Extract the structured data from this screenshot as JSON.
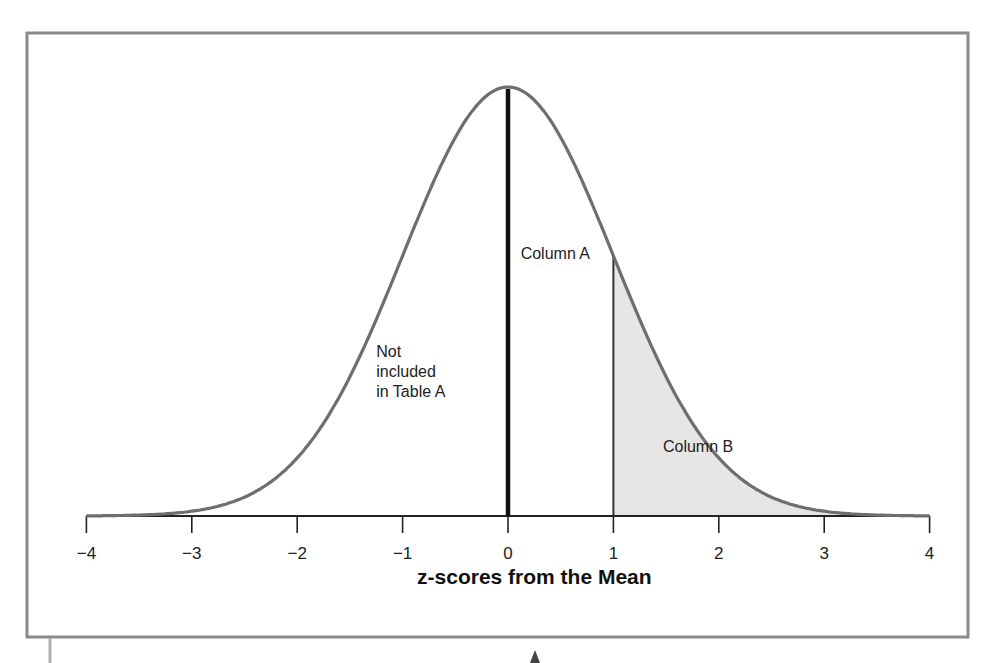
{
  "chart_data": {
    "type": "area",
    "title": "",
    "xlabel": "z-scores from the Mean",
    "ylabel": "",
    "xlim": [
      -4,
      4
    ],
    "x_ticks": [
      -4,
      -3,
      -2,
      -1,
      0,
      1,
      2,
      3,
      4
    ],
    "x_tick_labels": [
      "−4",
      "−3",
      "−2",
      "−1",
      "0",
      "1",
      "2",
      "3",
      "4"
    ],
    "curve": {
      "name": "Standard normal distribution",
      "mean": 0,
      "sd": 1
    },
    "mean_line": {
      "z": 0
    },
    "cutoff_line": {
      "z": 1
    },
    "shaded_region": {
      "from_z": 1,
      "to_z": 4,
      "label": "Column B"
    },
    "annotations": [
      {
        "id": "column-a",
        "text": "Column A",
        "z": 0.12,
        "height_frac": 0.6
      },
      {
        "id": "not-included",
        "lines": [
          "Not",
          "included",
          "in Table A"
        ],
        "z": -1.25,
        "height_frac": 0.37
      },
      {
        "id": "column-b",
        "text": "Column B",
        "z": 1.47,
        "height_frac": 0.15
      }
    ],
    "grid": false,
    "legend": null
  },
  "colors": {
    "frame": "#8a8a8a",
    "curve": "#6e6e6e",
    "mean_line": "#111111",
    "cutoff_line": "#333333",
    "shade": "#e6e6e6",
    "axis": "#222222"
  },
  "layout": {
    "x0_px": 508,
    "px_per_z": 105.4,
    "baseline_px": 516,
    "peak_height_px": 429
  }
}
